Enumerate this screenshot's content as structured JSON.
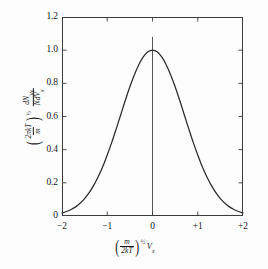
{
  "chart_data": {
    "type": "line",
    "title": "",
    "subtitle": "",
    "xlabel": "(m/2kT)^(1/2) Vx",
    "ylabel": "(2*pi*k*T/m)^(1/2) dN_Vx/(N dVx)",
    "xlim": [
      -2,
      2
    ],
    "ylim": [
      0,
      1.2
    ],
    "grid": false,
    "legend": null,
    "annotations": [
      {
        "name": "peak-marker",
        "type": "vertical-line",
        "x": 0,
        "y_from": 0,
        "y_to": 1.08
      }
    ],
    "x": [
      -2.0,
      -1.9,
      -1.8,
      -1.7,
      -1.6,
      -1.5,
      -1.4,
      -1.3,
      -1.2,
      -1.1,
      -1.0,
      -0.9,
      -0.8,
      -0.7,
      -0.6,
      -0.5,
      -0.4,
      -0.3,
      -0.2,
      -0.1,
      0.0,
      0.1,
      0.2,
      0.3,
      0.4,
      0.5,
      0.6,
      0.7,
      0.8,
      0.9,
      1.0,
      1.1,
      1.2,
      1.3,
      1.4,
      1.5,
      1.6,
      1.7,
      1.8,
      1.9,
      2.0
    ],
    "y": [
      0.018,
      0.027,
      0.039,
      0.055,
      0.077,
      0.105,
      0.141,
      0.185,
      0.237,
      0.297,
      0.368,
      0.444,
      0.527,
      0.612,
      0.698,
      0.779,
      0.852,
      0.914,
      0.961,
      0.99,
      1.0,
      0.99,
      0.961,
      0.914,
      0.852,
      0.779,
      0.698,
      0.612,
      0.527,
      0.444,
      0.368,
      0.297,
      0.237,
      0.185,
      0.141,
      0.105,
      0.077,
      0.055,
      0.039,
      0.027,
      0.018
    ],
    "xticks": [
      -2,
      -1,
      0,
      1,
      2
    ],
    "xtick_labels": [
      "−2",
      "−1",
      "0",
      "+1",
      "+2"
    ],
    "yticks": [
      0,
      0.2,
      0.4,
      0.6,
      0.8,
      1.0,
      1.2
    ],
    "ytick_labels": [
      "0",
      "0.2",
      "0.4",
      "0.6",
      "0.8",
      "1.0",
      "1.2"
    ],
    "colors": {
      "curve": "#2b2b2b",
      "axis": "#3b3b3b",
      "text": "#1a1a1a",
      "background": "#fdfdfd"
    }
  },
  "axis_titles": {
    "x": {
      "coefficient_numerator": "m",
      "coefficient_denominator": "2kT",
      "exponent": "½",
      "variable": "V",
      "variable_subscript": "x"
    },
    "y": {
      "coefficient_numerator": "2πkT",
      "coefficient_denominator": "m",
      "exponent": "½",
      "fraction_numerator": "dN",
      "fraction_numerator_subscript": "V",
      "fraction_numerator_subscript2": "x",
      "fraction_denominator": "NdV",
      "fraction_denominator_subscript": "x"
    }
  }
}
